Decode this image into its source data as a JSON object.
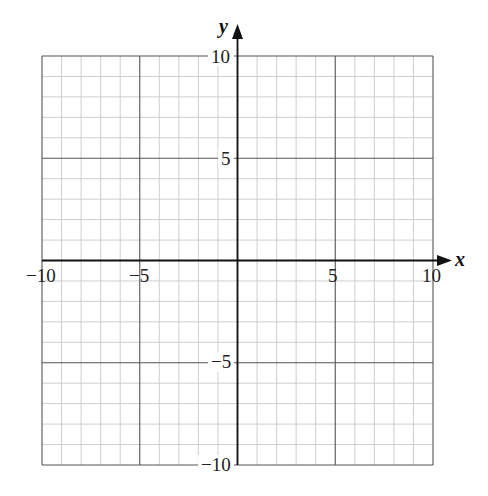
{
  "chart_data": {
    "type": "coordinate-grid",
    "title": "",
    "xlabel": "x",
    "ylabel": "y",
    "xlim": [
      -10,
      10
    ],
    "ylim": [
      -10,
      10
    ],
    "grid": true,
    "minor_step": 1,
    "major_step": 5,
    "x_tick_labels": [
      "-10",
      "-5",
      "5",
      "10"
    ],
    "y_tick_labels": [
      "10",
      "5",
      "-5",
      "-10"
    ],
    "x_ticks": [
      -10,
      -5,
      5,
      10
    ],
    "y_ticks": [
      10,
      5,
      -5,
      -10
    ],
    "series": []
  },
  "labels": {
    "x_axis": "x",
    "y_axis": "y",
    "xt": {
      "n10": "−10",
      "n5": "−5",
      "p5": "5",
      "p10": "10"
    },
    "yt": {
      "p10": "10",
      "p5": "5",
      "n5": "−5",
      "n10": "−10"
    }
  },
  "colors": {
    "minor_grid": "#c8c8c8",
    "major_grid": "#555555",
    "axis": "#111111"
  }
}
